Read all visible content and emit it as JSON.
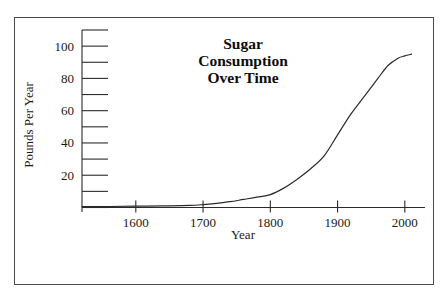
{
  "chart_data": {
    "type": "line",
    "title": "Sugar Consumption Over Time",
    "title_lines": [
      "Sugar",
      "Consumption",
      "Over Time"
    ],
    "xlabel": "Year",
    "ylabel": "Pounds Per Year",
    "xlim": [
      1520,
      2030
    ],
    "ylim": [
      0,
      110
    ],
    "grid": false,
    "legend": false,
    "x_ticks": [
      1600,
      1700,
      1800,
      1900,
      2000
    ],
    "x_tick_labels": [
      "1600",
      "1700",
      "1800",
      "1900",
      "2000"
    ],
    "y_ticks": [
      20,
      40,
      60,
      80,
      100
    ],
    "y_tick_labels": [
      "20",
      "40",
      "60",
      "80",
      "100"
    ],
    "y_minor_ticks": [
      0,
      10,
      30,
      50,
      70,
      90,
      110
    ],
    "series": [
      {
        "name": "Sugar consumption",
        "color": "#2b2b2b",
        "x": [
          1520,
          1560,
          1600,
          1640,
          1680,
          1700,
          1720,
          1740,
          1760,
          1780,
          1800,
          1820,
          1840,
          1860,
          1880,
          1900,
          1920,
          1940,
          1960,
          1975,
          1990,
          2000,
          2010
        ],
        "y": [
          0.5,
          0.6,
          0.8,
          1.0,
          1.3,
          1.8,
          2.6,
          3.6,
          5.0,
          6.4,
          8.0,
          12.0,
          17.5,
          24.0,
          32.0,
          45.0,
          58.0,
          69.0,
          80.0,
          88.0,
          92.5,
          94.0,
          95.0
        ]
      }
    ]
  },
  "axes": {
    "y_axis_name": "pounds-per-year-axis",
    "x_axis_name": "year-axis"
  }
}
